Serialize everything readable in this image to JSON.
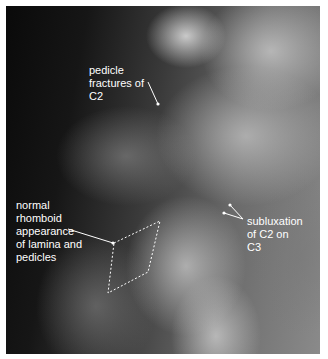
{
  "image": {
    "description": "Lateral cervical spine X-ray with annotations",
    "annotations": [
      {
        "id": "pedicle-fractures",
        "text": "pedicle\nfractures of\nC2"
      },
      {
        "id": "rhomboid",
        "text": "normal\nrhomboid\nappearance\nof lamina and\npedicles"
      },
      {
        "id": "subluxation",
        "text": "subluxation\nof C2 on\nC3"
      }
    ],
    "colors": {
      "annotation": "#ffffff",
      "border": "#ffffff"
    }
  }
}
